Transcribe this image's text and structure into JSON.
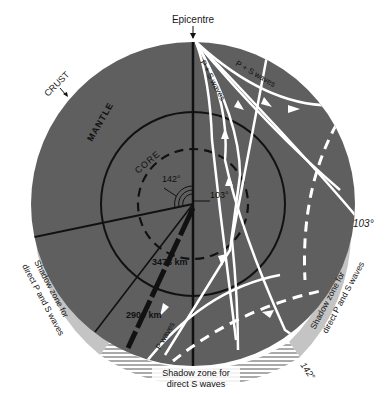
{
  "diagram": {
    "title_label": "Epicentre",
    "layers": {
      "crust": "CRUST",
      "mantle": "MANTLE",
      "core": "CORE"
    },
    "angles": {
      "a103_center": "103°",
      "a142_center": "142°",
      "a103_edge": "103°",
      "a142_edge": "142°"
    },
    "distances": {
      "core_radius": "3473 km",
      "mantle_depth": "2900 km"
    },
    "wave_labels": {
      "ps_waves_1": "P + S waves",
      "ps_waves_2": "P + S waves",
      "p_waves": "P waves"
    },
    "shadow_zones": {
      "left_line1": "Shadow zone for",
      "left_line2": "direct P and S waves",
      "right_line1": "Shadow zone for",
      "right_line2": "direct P and S waves",
      "bottom_line1": "Shadow zone for",
      "bottom_line2": "direct S waves"
    },
    "colors": {
      "mantle": "#5f5f5f",
      "shadow_band": "#c4c4c4",
      "rays": "#ffffff",
      "lines": "#111111",
      "background": "#ffffff"
    }
  }
}
